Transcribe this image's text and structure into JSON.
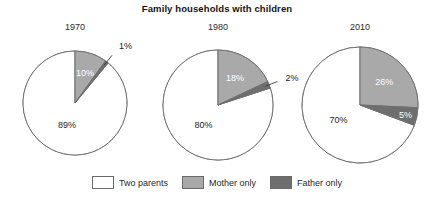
{
  "chart_data": {
    "type": "pie",
    "title": "Family households with children",
    "xlabel": "",
    "ylabel": "",
    "legend_position": "bottom",
    "categories": [
      "Two parents",
      "Mother only",
      "Father only"
    ],
    "colors": [
      "#ffffff",
      "#a9a9a9",
      "#6e6e6e"
    ],
    "units": "percent",
    "panels": [
      {
        "label": "1970",
        "values": [
          89,
          10,
          1
        ],
        "value_labels": [
          "89%",
          "10%",
          "1%"
        ]
      },
      {
        "label": "1980",
        "values": [
          80,
          18,
          2
        ],
        "value_labels": [
          "80%",
          "18%",
          "2%"
        ]
      },
      {
        "label": "2010",
        "values": [
          70,
          26,
          5
        ],
        "value_labels": [
          "70%",
          "26%",
          "5%"
        ]
      }
    ]
  },
  "legend": {
    "items": [
      {
        "label": "Two parents",
        "color": "#ffffff"
      },
      {
        "label": "Mother only",
        "color": "#a9a9a9"
      },
      {
        "label": "Father only",
        "color": "#6e6e6e"
      }
    ]
  }
}
